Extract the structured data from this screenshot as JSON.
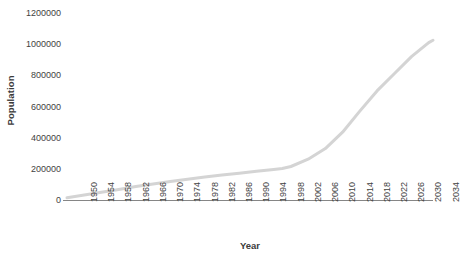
{
  "chart_data": {
    "type": "line",
    "title": "",
    "xlabel": "Year",
    "ylabel": "Population",
    "xlim": [
      1950,
      2035
    ],
    "ylim": [
      0,
      1200000
    ],
    "grid": false,
    "legend": false,
    "line_color": "#d4d4d4",
    "axis_color": "#868686",
    "text_color": "#3f3f3f",
    "x_tick_labels": [
      "1950",
      "1954",
      "1958",
      "1962",
      "1966",
      "1970",
      "1974",
      "1978",
      "1982",
      "1986",
      "1990",
      "1994",
      "1998",
      "2002",
      "2006",
      "2010",
      "2014",
      "2018",
      "2022",
      "2026",
      "2030",
      "2034"
    ],
    "y_tick_labels": [
      "1200000",
      "1000000",
      "800000",
      "600000",
      "400000",
      "200000",
      "0"
    ],
    "y_tick_values": [
      1200000,
      1000000,
      800000,
      600000,
      400000,
      200000,
      0
    ],
    "series": [
      {
        "name": "Population",
        "x": [
          1950,
          1954,
          1958,
          1962,
          1966,
          1970,
          1974,
          1978,
          1982,
          1986,
          1990,
          1994,
          1998,
          2000,
          2002,
          2006,
          2010,
          2014,
          2018,
          2022,
          2026,
          2030,
          2034,
          2035
        ],
        "values": [
          15000,
          32000,
          50000,
          68000,
          86000,
          103000,
          119000,
          133000,
          147000,
          160000,
          172000,
          184000,
          196000,
          202000,
          215000,
          262000,
          330000,
          435000,
          570000,
          700000,
          810000,
          920000,
          1010000,
          1025000
        ]
      }
    ]
  }
}
